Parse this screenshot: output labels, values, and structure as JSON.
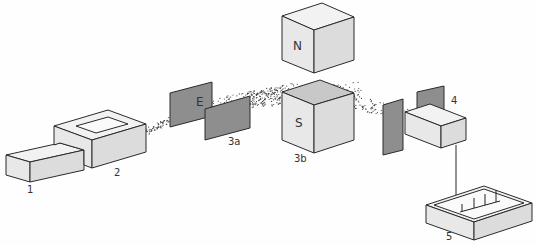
{
  "figure": {
    "components": [
      {
        "id": "1",
        "label": "1",
        "name": "sample inlet"
      },
      {
        "id": "2",
        "label": "2",
        "name": "ion source"
      },
      {
        "id": "3a",
        "label": "3a",
        "name": "electric deflection plates",
        "field_label": "E"
      },
      {
        "id": "3b",
        "label": "3b",
        "name": "magnet",
        "north_label": "N",
        "south_label": "S"
      },
      {
        "id": "4",
        "label": "4",
        "name": "detector"
      },
      {
        "id": "5",
        "label": "5",
        "name": "recorder"
      }
    ]
  }
}
